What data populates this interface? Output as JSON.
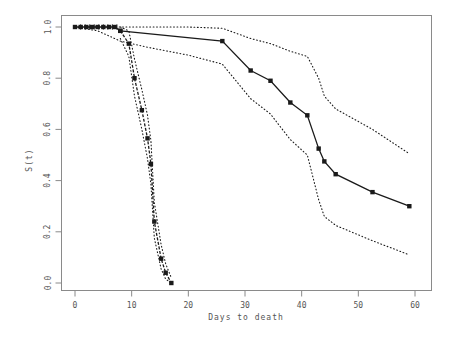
{
  "chart_data": {
    "type": "line",
    "title": "",
    "subtitle": "",
    "xlabel": "Days to death",
    "ylabel": "S(t)",
    "xlim": [
      -2,
      62
    ],
    "ylim": [
      0.0,
      1.0
    ],
    "xticks": [
      0,
      10,
      20,
      30,
      40,
      50,
      60
    ],
    "xtick_labels": [
      "0",
      "10",
      "20",
      "30",
      "40",
      "50",
      "60"
    ],
    "yticks": [
      0.0,
      0.2,
      0.4,
      0.6,
      0.8,
      1.0
    ],
    "ytick_labels": [
      "0.0",
      "0.2",
      "0.4",
      "0.6",
      "0.8",
      "1.0"
    ],
    "grid": false,
    "legend": "none",
    "marker": "filled-square",
    "series": [
      {
        "name": "group-a-survival",
        "style": "solid",
        "marker": true,
        "points": [
          {
            "x": 0.0,
            "y": 1.0
          },
          {
            "x": 1.0,
            "y": 1.0
          },
          {
            "x": 2.0,
            "y": 1.0
          },
          {
            "x": 3.0,
            "y": 1.0
          },
          {
            "x": 4.0,
            "y": 1.0
          },
          {
            "x": 5.0,
            "y": 1.0
          },
          {
            "x": 6.0,
            "y": 1.0
          },
          {
            "x": 7.0,
            "y": 1.0
          },
          {
            "x": 8.0,
            "y": 0.985
          },
          {
            "x": 26.0,
            "y": 0.945
          },
          {
            "x": 31.0,
            "y": 0.83
          },
          {
            "x": 34.5,
            "y": 0.79
          },
          {
            "x": 38.0,
            "y": 0.705
          },
          {
            "x": 41.0,
            "y": 0.655
          },
          {
            "x": 43.0,
            "y": 0.525
          },
          {
            "x": 44.0,
            "y": 0.475
          },
          {
            "x": 46.0,
            "y": 0.425
          },
          {
            "x": 52.5,
            "y": 0.355
          },
          {
            "x": 59.0,
            "y": 0.3
          }
        ]
      },
      {
        "name": "group-a-upper-ci",
        "style": "dotted",
        "marker": false,
        "points": [
          {
            "x": 0.0,
            "y": 1.0
          },
          {
            "x": 8.0,
            "y": 1.0
          },
          {
            "x": 20.0,
            "y": 1.0
          },
          {
            "x": 26.0,
            "y": 0.995
          },
          {
            "x": 31.0,
            "y": 0.955
          },
          {
            "x": 34.5,
            "y": 0.935
          },
          {
            "x": 38.0,
            "y": 0.905
          },
          {
            "x": 41.0,
            "y": 0.885
          },
          {
            "x": 43.0,
            "y": 0.8
          },
          {
            "x": 44.0,
            "y": 0.73
          },
          {
            "x": 46.0,
            "y": 0.68
          },
          {
            "x": 52.5,
            "y": 0.6
          },
          {
            "x": 59.0,
            "y": 0.505
          }
        ]
      },
      {
        "name": "group-a-lower-ci",
        "style": "dotted",
        "marker": false,
        "points": [
          {
            "x": 0.0,
            "y": 1.0
          },
          {
            "x": 4.0,
            "y": 0.985
          },
          {
            "x": 8.0,
            "y": 0.945
          },
          {
            "x": 13.0,
            "y": 0.92
          },
          {
            "x": 20.0,
            "y": 0.89
          },
          {
            "x": 26.0,
            "y": 0.855
          },
          {
            "x": 31.0,
            "y": 0.72
          },
          {
            "x": 34.5,
            "y": 0.66
          },
          {
            "x": 38.0,
            "y": 0.56
          },
          {
            "x": 41.0,
            "y": 0.5
          },
          {
            "x": 43.0,
            "y": 0.325
          },
          {
            "x": 44.0,
            "y": 0.26
          },
          {
            "x": 46.0,
            "y": 0.225
          },
          {
            "x": 52.5,
            "y": 0.165
          },
          {
            "x": 59.0,
            "y": 0.11
          }
        ]
      },
      {
        "name": "group-b-survival",
        "style": "dashed",
        "marker": true,
        "points": [
          {
            "x": 8.0,
            "y": 0.985
          },
          {
            "x": 9.5,
            "y": 0.935
          },
          {
            "x": 10.5,
            "y": 0.8
          },
          {
            "x": 11.8,
            "y": 0.675
          },
          {
            "x": 12.8,
            "y": 0.565
          },
          {
            "x": 13.4,
            "y": 0.465
          },
          {
            "x": 14.0,
            "y": 0.24
          },
          {
            "x": 15.2,
            "y": 0.095
          },
          {
            "x": 16.0,
            "y": 0.04
          },
          {
            "x": 17.0,
            "y": 0.0
          }
        ]
      },
      {
        "name": "group-b-upper-ci",
        "style": "dotted",
        "marker": false,
        "points": [
          {
            "x": 8.0,
            "y": 1.0
          },
          {
            "x": 9.5,
            "y": 0.985
          },
          {
            "x": 10.5,
            "y": 0.875
          },
          {
            "x": 11.8,
            "y": 0.755
          },
          {
            "x": 12.8,
            "y": 0.655
          },
          {
            "x": 13.4,
            "y": 0.555
          },
          {
            "x": 14.0,
            "y": 0.315
          },
          {
            "x": 15.2,
            "y": 0.15
          },
          {
            "x": 16.0,
            "y": 0.075
          },
          {
            "x": 17.0,
            "y": 0.02
          }
        ]
      },
      {
        "name": "group-b-lower-ci",
        "style": "dotted",
        "marker": false,
        "points": [
          {
            "x": 8.0,
            "y": 0.955
          },
          {
            "x": 9.5,
            "y": 0.885
          },
          {
            "x": 10.5,
            "y": 0.73
          },
          {
            "x": 11.8,
            "y": 0.6
          },
          {
            "x": 12.8,
            "y": 0.485
          },
          {
            "x": 13.4,
            "y": 0.385
          },
          {
            "x": 14.0,
            "y": 0.175
          },
          {
            "x": 15.2,
            "y": 0.055
          },
          {
            "x": 16.0,
            "y": 0.015
          },
          {
            "x": 17.0,
            "y": 0.0
          }
        ]
      }
    ],
    "censor_ticks": [
      {
        "x": 1.0,
        "y": 1.0
      },
      {
        "x": 1.8,
        "y": 1.0
      },
      {
        "x": 2.6,
        "y": 1.0
      },
      {
        "x": 3.4,
        "y": 1.0
      },
      {
        "x": 4.2,
        "y": 1.0
      },
      {
        "x": 5.0,
        "y": 1.0
      },
      {
        "x": 5.8,
        "y": 1.0
      },
      {
        "x": 6.6,
        "y": 1.0
      },
      {
        "x": 7.4,
        "y": 1.0
      }
    ]
  },
  "plot": {
    "frame_color": "#8a8a8a",
    "line_color": "#1a1a1a",
    "text_color": "#555555"
  }
}
